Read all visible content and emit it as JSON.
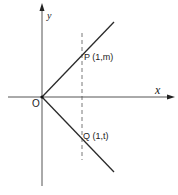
{
  "diagram": {
    "axes": {
      "x_label": "x",
      "y_label": "y",
      "origin_label": "O"
    },
    "points": [
      {
        "name": "P",
        "label": "P (1,m)"
      },
      {
        "name": "Q",
        "label": "Q (1,t)"
      }
    ],
    "lines": [
      {
        "name": "upper-ray",
        "from": "O",
        "through": "P"
      },
      {
        "name": "lower-ray",
        "from": "O",
        "through": "Q"
      },
      {
        "name": "dashed-line",
        "equation": "x = 1",
        "style": "dashed"
      }
    ],
    "colors": {
      "stroke": "#2a2a2a",
      "axis": "#555555",
      "background": "#ffffff"
    }
  }
}
